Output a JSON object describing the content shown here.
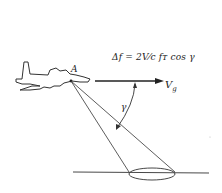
{
  "diagram": {
    "formula": "Δf = (2V/c) f_T cos γ",
    "formula_display": "Δf = 2V⁄c fᴛ cos γ",
    "point_label": "A",
    "velocity_label": "V",
    "velocity_subscript": "g",
    "angle_label": "γ",
    "elements": [
      "aircraft",
      "velocity-vector",
      "radar-beam-cone",
      "ground-footprint-ellipse",
      "ground-line",
      "angle-arc"
    ],
    "line_color": "#222222",
    "background": "#ffffff"
  }
}
